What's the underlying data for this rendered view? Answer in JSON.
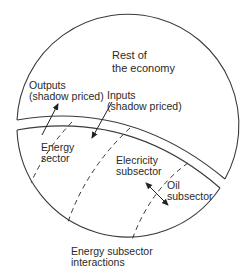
{
  "diagram": {
    "regions": {
      "rest_of_economy": "Rest of\nthe economy",
      "energy_sector": "Energy\nsector",
      "electricity_subsector": "Elecricity\nsubsector",
      "oil_subsector": "Oil\nsubsector"
    },
    "flows": {
      "outputs": "Outputs\n(shadow priced)",
      "inputs": "Inputs\n(shadow priced)"
    },
    "caption": "Energy subsector\ninteractions",
    "colors": {
      "line": "#3a3a3a",
      "background": "#ffffff"
    }
  }
}
